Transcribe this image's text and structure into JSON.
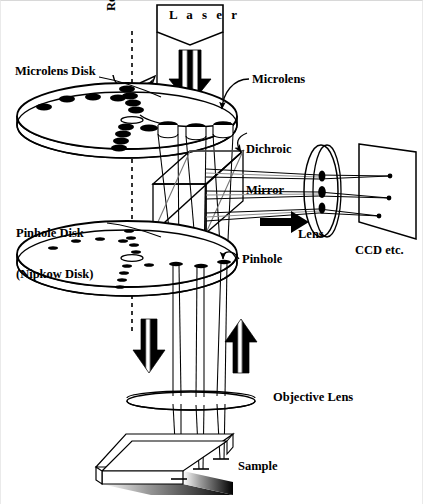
{
  "figure": {
    "background_color": "#ffffff",
    "ink_color": "#000000"
  },
  "labels": {
    "laser": "L a s e r",
    "rotation": "Rotation",
    "microlens_disk": "Microlens Disk",
    "microlens": "Microlens",
    "dichroic_mirror_line1": "Dichroic",
    "dichroic_mirror_line2": "Mirror",
    "pinhole_disk_line1": "Pinhole Disk",
    "pinhole_disk_line2": "(Nipkow Disk)",
    "pinhole": "Pinhole",
    "lens": "Lens",
    "ccd": "CCD etc.",
    "objective_lens": "Objective Lens",
    "sample": "Sample"
  },
  "components": {
    "laser_source": {
      "name": "Laser",
      "shape": "rectangle-with-chevron-base",
      "x": 156,
      "y": 4,
      "width": 66,
      "height": 43
    },
    "excitation_arrow": {
      "name": "downward thick arrow from laser",
      "direction": "down",
      "x": 189,
      "y": 47,
      "height": 45
    },
    "microlens_disk": {
      "name": "Microlens Disk",
      "shape": "ellipse-disk-3d",
      "cx": 126,
      "cy": 115,
      "rx": 110,
      "ry": 33,
      "thickness": 9,
      "features": "spiral array of microlenses",
      "microlens_count": 19
    },
    "pinhole_disk": {
      "name": "Pinhole Disk (Nipkow Disk)",
      "shape": "ellipse-disk-3d",
      "cx": 126,
      "cy": 253,
      "rx": 110,
      "ry": 33,
      "thickness": 9,
      "features": "spiral array of pinholes",
      "pinhole_count": 19
    },
    "dichroic_mirror": {
      "name": "Dichroic Mirror",
      "shape": "cube-with-diagonal-plane",
      "x": 152,
      "y": 150,
      "width": 90,
      "height": 68
    },
    "relay_lens": {
      "name": "Lens",
      "shape": "tall-ellipse",
      "cx": 320,
      "cy": 190,
      "rx": 17,
      "ry": 46,
      "marks": 3
    },
    "ccd_plane": {
      "name": "CCD etc.",
      "shape": "tilted-quadrilateral",
      "x": 355,
      "y": 143,
      "width": 60,
      "height": 95,
      "image_points": 3
    },
    "objective_lens": {
      "name": "Objective Lens",
      "shape": "flat-ellipse",
      "cx": 190,
      "cy": 400,
      "rx": 64,
      "ry": 9
    },
    "sample": {
      "name": "Sample",
      "shape": "3d-slab-with-shadow",
      "x": 95,
      "y": 432,
      "width": 140,
      "height": 55,
      "focus_points": 3
    },
    "rotation_axis": {
      "name": "rotation axis",
      "style": "vertical dashed line",
      "x": 131,
      "y_top": 30,
      "y_bottom": 330
    },
    "rotation_arrow": {
      "name": "curved rotation arrow",
      "style": "arc with arrowhead pointing up-right"
    },
    "illumination_arrow_down": {
      "name": "excitation beam direction",
      "direction": "down",
      "x": 148,
      "y": 320,
      "height": 48
    },
    "emission_arrow_up": {
      "name": "fluorescence emission direction",
      "direction": "up",
      "x": 237,
      "y": 320,
      "height": 48
    },
    "focus_beams": {
      "count": 3,
      "description": "three converging beam pairs from microlenses through pinholes to sample"
    }
  }
}
